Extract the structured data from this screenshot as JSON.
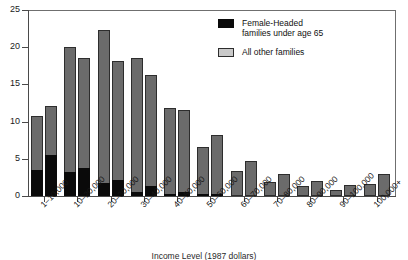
{
  "chart_data": {
    "type": "bar",
    "title": "",
    "subtitle": "",
    "xlabel": "Income Level (1987 dollars)",
    "ylabel": "",
    "ylim": [
      0,
      25
    ],
    "yticks": [
      0,
      5,
      10,
      15,
      20,
      25
    ],
    "ytick_labels": [
      "0",
      "5",
      "10",
      "15",
      "20",
      "25"
    ],
    "grid": false,
    "legend_position": "top-right",
    "categories": [
      "1–10,000",
      "10–20,000",
      "20–30,000",
      "30–40,000",
      "40–50,000",
      "50–60,000",
      "60–70,000",
      "70–80,000",
      "80–90,000",
      "90–100,000",
      "100,000+"
    ],
    "legend": [
      {
        "label": "Female-Headed families under age 65",
        "color": "#0a0a0a",
        "key": "female_headed"
      },
      {
        "label": "All other families",
        "color": "#c9c9c9",
        "key": "all_other"
      }
    ],
    "series": [
      {
        "name": "Bar 1 (first of pair)",
        "totals": [
          10.8,
          20.0,
          22.3,
          18.5,
          11.8,
          6.6,
          3.4,
          1.9,
          1.3,
          0.8,
          1.6
        ],
        "female_headed": [
          3.5,
          3.2,
          1.8,
          0.5,
          0.3,
          0.1,
          0.0,
          0.0,
          0.0,
          0.0,
          0.0
        ]
      },
      {
        "name": "Bar 2 (second of pair)",
        "totals": [
          12.1,
          18.5,
          18.2,
          16.2,
          11.6,
          8.2,
          4.7,
          2.9,
          2.0,
          1.5,
          3.0
        ],
        "female_headed": [
          5.5,
          3.7,
          2.1,
          1.3,
          0.5,
          0.1,
          0.0,
          0.0,
          0.0,
          0.0,
          0.0
        ]
      }
    ]
  },
  "legend": {
    "item1_line1": "Female-Headed",
    "item1_line2": "families under age 65",
    "item2_line1": "All other families"
  },
  "axis": {
    "x_title": "Income Level (1987 dollars)"
  },
  "colors": {
    "bar_gray": "#6b6b6b",
    "bar_black": "#0a0a0a",
    "axis": "#4a4a4a"
  }
}
